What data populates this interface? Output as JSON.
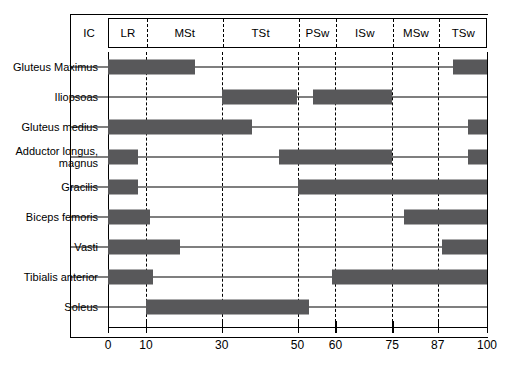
{
  "chart_data": {
    "type": "bar",
    "title": "",
    "xlabel": "",
    "ylabel": "",
    "xlim": [
      0,
      100
    ],
    "grid": true,
    "legend": "none",
    "orientation": "horizontal",
    "bar_color": "#58585a",
    "x_ticks": [
      0,
      10,
      30,
      50,
      60,
      75,
      87,
      100
    ],
    "x_tick_labels": [
      "0",
      "10",
      "30",
      "50",
      "60",
      "75",
      "87",
      "100"
    ],
    "phase_header_label": "IC",
    "phases": [
      {
        "label": "LR",
        "start": 0,
        "end": 10
      },
      {
        "label": "MSt",
        "start": 10,
        "end": 30
      },
      {
        "label": "TSt",
        "start": 30,
        "end": 50
      },
      {
        "label": "PSw",
        "start": 50,
        "end": 60
      },
      {
        "label": "ISw",
        "start": 60,
        "end": 75
      },
      {
        "label": "MSw",
        "start": 75,
        "end": 87
      },
      {
        "label": "TSw",
        "start": 87,
        "end": 100
      }
    ],
    "gridlines": [
      0,
      10,
      30,
      50,
      60,
      75,
      87,
      100
    ],
    "categories": [
      "Gluteus Maximus",
      "Iliopsoas",
      "Gluteus medius",
      "Adductor longus, magnus",
      "Gracilis",
      "Biceps femoris",
      "Vasti",
      "Tibialis anterior",
      "Soleus"
    ],
    "rows": [
      {
        "label": "Gluteus Maximus",
        "label_lines": [
          "Gluteus Maximus"
        ],
        "intervals": [
          [
            0,
            23
          ],
          [
            91,
            100
          ]
        ]
      },
      {
        "label": "Iliopsoas",
        "label_lines": [
          "Iliopsoas"
        ],
        "intervals": [
          [
            30,
            50
          ],
          [
            54,
            75
          ]
        ]
      },
      {
        "label": "Gluteus medius",
        "label_lines": [
          "Gluteus medius"
        ],
        "intervals": [
          [
            0,
            38
          ],
          [
            95,
            100
          ]
        ]
      },
      {
        "label": "Adductor longus, magnus",
        "label_lines": [
          "Adductor longus,",
          "magnus"
        ],
        "intervals": [
          [
            0,
            8
          ],
          [
            45,
            75
          ],
          [
            95,
            100
          ]
        ]
      },
      {
        "label": "Gracilis",
        "label_lines": [
          "Gracilis"
        ],
        "intervals": [
          [
            0,
            8
          ],
          [
            50,
            100
          ]
        ]
      },
      {
        "label": "Biceps femoris",
        "label_lines": [
          "Biceps femoris"
        ],
        "intervals": [
          [
            0,
            11
          ],
          [
            78,
            100
          ]
        ]
      },
      {
        "label": "Vasti",
        "label_lines": [
          "Vasti"
        ],
        "intervals": [
          [
            0,
            19
          ],
          [
            88,
            100
          ]
        ]
      },
      {
        "label": "Tibialis anterior",
        "label_lines": [
          "Tibialis anterior"
        ],
        "intervals": [
          [
            0,
            12
          ],
          [
            59,
            100
          ]
        ]
      },
      {
        "label": "Soleus",
        "label_lines": [
          "Soleus"
        ],
        "intervals": [
          [
            10,
            53
          ]
        ]
      }
    ]
  }
}
